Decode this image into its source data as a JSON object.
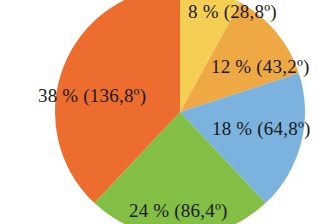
{
  "chart_data": {
    "type": "pie",
    "title": "",
    "subtitle": "",
    "xlabel": "",
    "ylabel": "",
    "legend_position": "none",
    "grid": false,
    "start_angle_deg": 0,
    "direction": "clockwise",
    "total_percent": 100,
    "total_degrees": 360,
    "categories": [
      "Slice 1",
      "Slice 2",
      "Slice 3",
      "Slice 4",
      "Slice 5"
    ],
    "values": [
      8,
      12,
      18,
      24,
      38
    ],
    "degrees": [
      28.8,
      43.2,
      64.8,
      86.4,
      136.8
    ],
    "colors": [
      "#f5cf54",
      "#efa944",
      "#7cb2de",
      "#83be45",
      "#ed6d2e"
    ],
    "slices": [
      {
        "name": "slice-yellow",
        "percent": 8,
        "degrees": 28.8,
        "color": "#f5cf54",
        "label": "8 % (28,8º)"
      },
      {
        "name": "slice-amber",
        "percent": 12,
        "degrees": 43.2,
        "color": "#efa944",
        "label": "12 % (43,2º)"
      },
      {
        "name": "slice-blue",
        "percent": 18,
        "degrees": 64.8,
        "color": "#7cb2de",
        "label": "18 % (64,8º)"
      },
      {
        "name": "slice-green",
        "percent": 24,
        "degrees": 86.4,
        "color": "#83be45",
        "label": "24 % (86,4º)"
      },
      {
        "name": "slice-orange",
        "percent": 38,
        "degrees": 136.8,
        "color": "#ed6d2e",
        "label": "38 % (136,8º)"
      }
    ],
    "labels": [
      "8 % (28,8º)",
      "12 % (43,2º)",
      "18 % (64,8º)",
      "24 % (86,4º)",
      "38 % (136,8º)"
    ]
  },
  "background_color": "#ffffff",
  "label_text_color": "#1a1a1a"
}
